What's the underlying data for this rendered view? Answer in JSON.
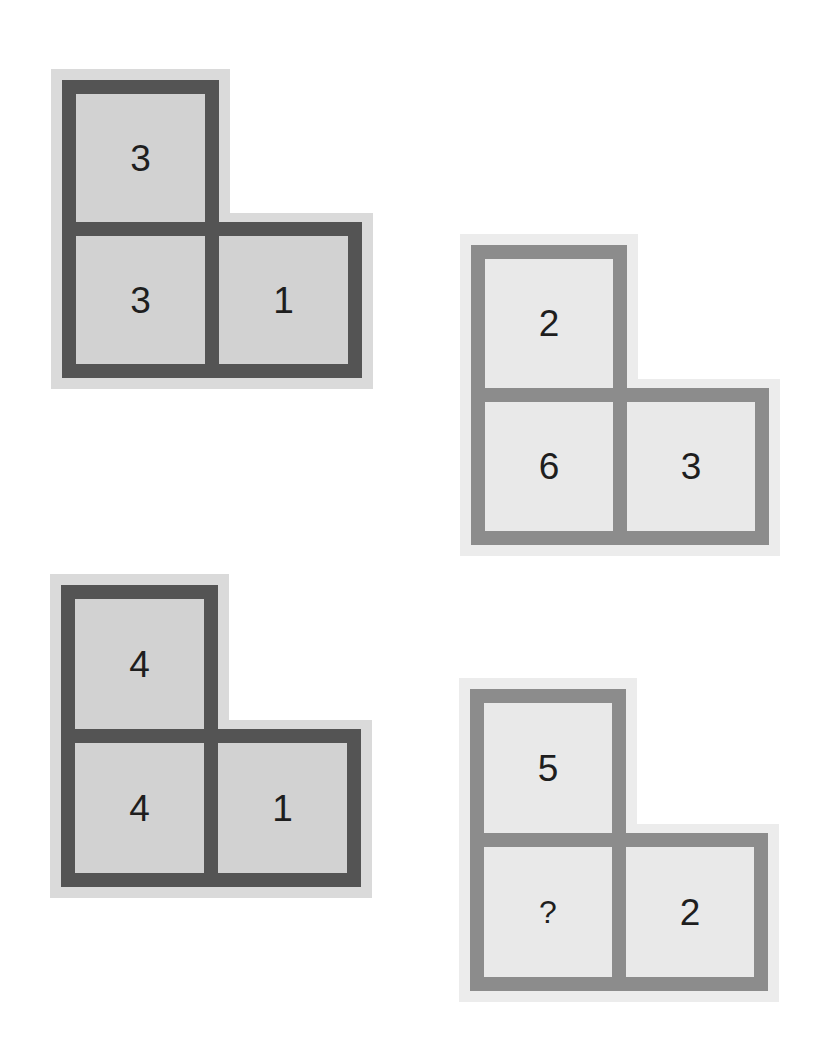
{
  "puzzle": {
    "figures": [
      {
        "id": "fig1",
        "style": "dark",
        "cells": {
          "top": "3",
          "bottom_left": "3",
          "bottom_right": "1"
        }
      },
      {
        "id": "fig2",
        "style": "light",
        "cells": {
          "top": "2",
          "bottom_left": "6",
          "bottom_right": "3"
        }
      },
      {
        "id": "fig3",
        "style": "dark",
        "cells": {
          "top": "4",
          "bottom_left": "4",
          "bottom_right": "1"
        }
      },
      {
        "id": "fig4",
        "style": "light",
        "cells": {
          "top": "5",
          "bottom_left": "?",
          "bottom_right": "2"
        }
      }
    ]
  },
  "colors": {
    "dark_border": "#545454",
    "dark_fill": "#d2d2d2",
    "light_border": "#8c8c8c",
    "light_fill": "#e9e9e9",
    "text": "#1e1e1e",
    "background": "#ffffff"
  }
}
